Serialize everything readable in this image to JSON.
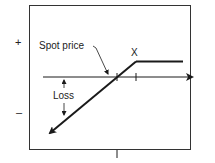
{
  "diagram": {
    "y_axis": {
      "plus_label": "+",
      "minus_label": "–"
    },
    "labels": {
      "spot_price": "Spot price",
      "strike": "X",
      "loss": "Loss"
    },
    "colors": {
      "line": "#1a1a1a",
      "frame": "#333333"
    }
  }
}
